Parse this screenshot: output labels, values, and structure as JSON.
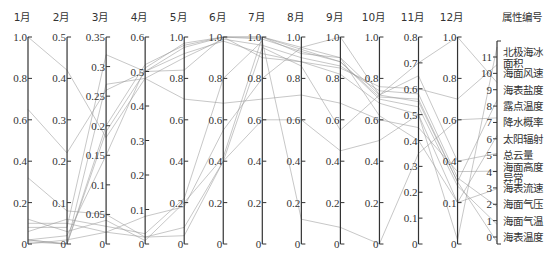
{
  "chart_data": {
    "type": "line",
    "subtype": "parallel-coordinates",
    "title": "",
    "axes": [
      {
        "label": "1月",
        "range": [
          0,
          1.0
        ],
        "ticks": [
          "0",
          "0.2",
          "0.4",
          "0.6",
          "0.8",
          "1.0"
        ],
        "tick_values": [
          0,
          0.2,
          0.4,
          0.6,
          0.8,
          1.0
        ]
      },
      {
        "label": "2月",
        "range": [
          0,
          0.5
        ],
        "ticks": [
          "0",
          "0.1",
          "0.2",
          "0.3",
          "0.4",
          "0.5"
        ],
        "tick_values": [
          0,
          0.1,
          0.2,
          0.3,
          0.4,
          0.5
        ]
      },
      {
        "label": "3月",
        "range": [
          0,
          0.35
        ],
        "ticks": [
          "0",
          "0.05",
          "0.1",
          "0.15",
          "0.2",
          "0.25",
          "0.3",
          "0.35"
        ],
        "tick_values": [
          0,
          0.05,
          0.1,
          0.15,
          0.2,
          0.25,
          0.3,
          0.35
        ]
      },
      {
        "label": "4月",
        "range": [
          0,
          0.6
        ],
        "ticks": [
          "0",
          "0.1",
          "0.2",
          "0.3",
          "0.4",
          "0.5",
          "0.6"
        ],
        "tick_values": [
          0,
          0.1,
          0.2,
          0.3,
          0.4,
          0.5,
          0.6
        ]
      },
      {
        "label": "5月",
        "range": [
          0,
          1.0
        ],
        "ticks": [
          "0",
          "0.2",
          "0.4",
          "0.6",
          "0.8",
          "1.0"
        ],
        "tick_values": [
          0,
          0.2,
          0.4,
          0.6,
          0.8,
          1.0
        ]
      },
      {
        "label": "6月",
        "range": [
          0,
          1.0
        ],
        "ticks": [
          "0",
          "0.2",
          "0.4",
          "0.6",
          "0.8",
          "1.0"
        ],
        "tick_values": [
          0,
          0.2,
          0.4,
          0.6,
          0.8,
          1.0
        ]
      },
      {
        "label": "7月",
        "range": [
          0,
          1.0
        ],
        "ticks": [
          "0",
          "0.2",
          "0.4",
          "0.6",
          "0.8",
          "1.0"
        ],
        "tick_values": [
          0,
          0.2,
          0.4,
          0.6,
          0.8,
          1.0
        ]
      },
      {
        "label": "8月",
        "range": [
          0,
          1.0
        ],
        "ticks": [
          "0",
          "0.2",
          "0.4",
          "0.6",
          "0.8",
          "1.0"
        ],
        "tick_values": [
          0,
          0.2,
          0.4,
          0.6,
          0.8,
          1.0
        ]
      },
      {
        "label": "9月",
        "range": [
          0,
          1.0
        ],
        "ticks": [
          "0",
          "0.2",
          "0.4",
          "0.6",
          "0.8",
          "1.0"
        ],
        "tick_values": [
          0,
          0.2,
          0.4,
          0.6,
          0.8,
          1.0
        ]
      },
      {
        "label": "10月",
        "range": [
          0,
          1.0
        ],
        "ticks": [
          "0",
          "0.2",
          "0.4",
          "0.6",
          "0.8",
          "1.0"
        ],
        "tick_values": [
          0,
          0.2,
          0.4,
          0.6,
          0.8,
          1.0
        ]
      },
      {
        "label": "11月",
        "range": [
          0,
          0.8
        ],
        "ticks": [
          "0",
          "0.1",
          "0.2",
          "0.3",
          "0.4",
          "0.5",
          "0.6",
          "0.7",
          "0.8"
        ],
        "tick_values": [
          0,
          0.1,
          0.2,
          0.3,
          0.4,
          0.5,
          0.6,
          0.7,
          0.8
        ]
      },
      {
        "label": "12月",
        "range": [
          0,
          1.0
        ],
        "ticks": [
          "0",
          "0.1",
          "0.4",
          "0.6",
          "0.8",
          "1.0"
        ],
        "tick_values": [
          0,
          0.2,
          0.4,
          0.6,
          0.8,
          1.0
        ]
      }
    ],
    "attribute_axis": {
      "label": "属性编号",
      "range": [
        0,
        11
      ],
      "ticks": [
        "0",
        "1",
        "2",
        "3",
        "4",
        "5",
        "6",
        "7",
        "8",
        "9",
        "10",
        "11"
      ],
      "names": [
        "海表温度",
        "海面气温",
        "海面气压",
        "海表流速",
        "海面高度异常",
        "总云量",
        "太阳辐射",
        "降水概率",
        "露点温度",
        "海表盐度",
        "海面风速",
        "北极海冰面积"
      ]
    },
    "series": [
      {
        "name": "海表温度",
        "attr": 0,
        "values": [
          0.01,
          0.0,
          0.19,
          0.5,
          0.95,
          1.0,
          1.0,
          0.95,
          0.9,
          0.72,
          0.55,
          0.3
        ]
      },
      {
        "name": "海面气温",
        "attr": 1,
        "values": [
          0.02,
          0.0,
          0.2,
          0.52,
          0.96,
          1.0,
          0.99,
          0.93,
          0.88,
          0.7,
          0.53,
          0.28
        ]
      },
      {
        "name": "海面气压",
        "attr": 2,
        "values": [
          1.0,
          0.42,
          0.18,
          0.48,
          0.9,
          0.99,
          0.96,
          0.9,
          0.86,
          0.74,
          0.58,
          0.32
        ]
      },
      {
        "name": "海表流速",
        "attr": 3,
        "values": [
          0.65,
          0.22,
          0.26,
          0.5,
          0.84,
          1.0,
          0.9,
          0.88,
          0.82,
          0.68,
          0.5,
          0.2
        ]
      },
      {
        "name": "海面高度异常",
        "attr": 4,
        "values": [
          0.02,
          0.0,
          0.27,
          0.48,
          0.7,
          0.68,
          0.7,
          0.72,
          0.68,
          0.6,
          0.45,
          0.35
        ]
      },
      {
        "name": "总云量",
        "attr": 5,
        "values": [
          0.32,
          0.08,
          0.05,
          0.02,
          0.08,
          0.4,
          0.95,
          0.86,
          0.55,
          0.72,
          0.65,
          0.4
        ]
      },
      {
        "name": "太阳辐射",
        "attr": 6,
        "values": [
          0.12,
          0.03,
          0.04,
          0.01,
          0.2,
          0.42,
          1.0,
          0.92,
          0.9,
          0.62,
          0.4,
          0.2
        ]
      },
      {
        "name": "降水概率",
        "attr": 7,
        "values": [
          0.06,
          0.06,
          0.03,
          0.03,
          0.22,
          0.8,
          0.98,
          0.12,
          0.08,
          0.0,
          0.35,
          0.6
        ]
      },
      {
        "name": "露点温度",
        "attr": 8,
        "values": [
          0.02,
          0.02,
          0.15,
          0.51,
          0.97,
          1.0,
          1.0,
          0.94,
          0.88,
          0.71,
          0.56,
          0.3
        ]
      },
      {
        "name": "海表盐度",
        "attr": 9,
        "values": [
          0.1,
          0.05,
          0.02,
          0.08,
          0.18,
          0.55,
          0.8,
          0.95,
          1.0,
          0.72,
          0.7,
          1.0
        ]
      },
      {
        "name": "海面风速",
        "attr": 10,
        "values": [
          0.08,
          0.04,
          0.32,
          0.5,
          0.92,
          0.98,
          0.92,
          0.88,
          0.85,
          0.76,
          0.6,
          0.7
        ]
      },
      {
        "name": "北极海冰面积",
        "attr": 11,
        "values": [
          0.0,
          0.01,
          0.02,
          0.02,
          0.04,
          0.4,
          0.6,
          0.6,
          0.45,
          0.5,
          0.5,
          0.02
        ]
      }
    ],
    "grid": false,
    "legend": "right-axis"
  }
}
